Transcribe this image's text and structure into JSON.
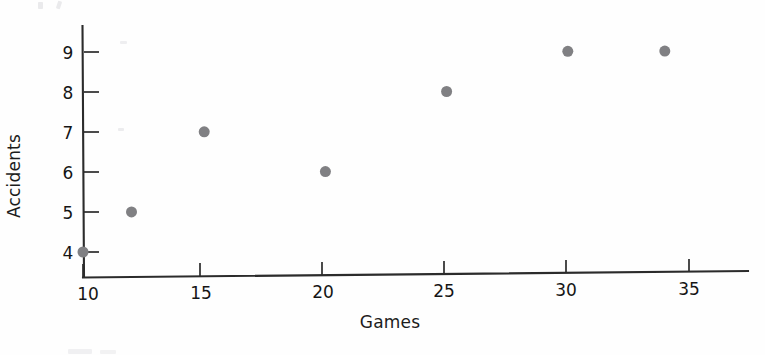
{
  "chart_data": {
    "type": "scatter",
    "title": "",
    "xlabel": "Games",
    "ylabel": "Accidents",
    "xlim": [
      8.8,
      36.5
    ],
    "ylim": [
      3.5,
      9.6
    ],
    "xticks": [
      10,
      15,
      20,
      25,
      30,
      35
    ],
    "yticks": [
      4,
      5,
      6,
      7,
      8,
      9
    ],
    "xtick_labels": [
      "10",
      "15",
      "20",
      "25",
      "30",
      "35"
    ],
    "ytick_labels": [
      "4",
      "5",
      "6",
      "7",
      "8",
      "9"
    ],
    "grid": false,
    "legend": null,
    "marker": {
      "shape": "circle",
      "color": "#808083",
      "size": 11
    },
    "series": [
      {
        "name": "Accidents vs Games",
        "points": [
          {
            "x": 10,
            "y": 4
          },
          {
            "x": 12,
            "y": 5
          },
          {
            "x": 15,
            "y": 7
          },
          {
            "x": 20,
            "y": 6
          },
          {
            "x": 25,
            "y": 8
          },
          {
            "x": 30,
            "y": 9
          },
          {
            "x": 34,
            "y": 9
          }
        ]
      }
    ]
  },
  "axes": {
    "x_title": "Games",
    "y_title": "Accidents"
  },
  "colors": {
    "marker": "#808083",
    "axis": "#2b2b2b",
    "text": "#1a1a1a",
    "background": "#ffffff"
  }
}
